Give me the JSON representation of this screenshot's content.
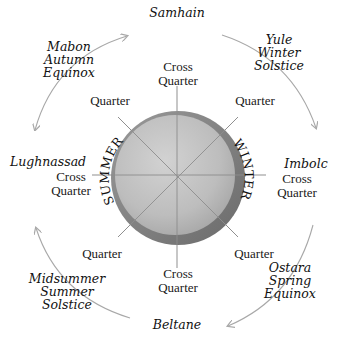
{
  "diagram": {
    "center_labels": {
      "left": "SUMMER",
      "right": "WINTER"
    },
    "festivals": {
      "top": {
        "lines": [
          "Samhain"
        ]
      },
      "top_right": {
        "lines": [
          "Yule",
          "Winter",
          "Solstice"
        ]
      },
      "right": {
        "lines": [
          "Imbolc"
        ]
      },
      "bottom_right": {
        "lines": [
          "Ostara",
          "Spring",
          "Equinox"
        ]
      },
      "bottom": {
        "lines": [
          "Beltane"
        ]
      },
      "bottom_left": {
        "lines": [
          "Midsummer",
          "Summer",
          "Solstice"
        ]
      },
      "left": {
        "lines": [
          "Lughnassad"
        ]
      },
      "top_left": {
        "lines": [
          "Mabon",
          "Autumn",
          "Equinox"
        ]
      }
    },
    "quarters": {
      "top": {
        "lines": [
          "Cross",
          "Quarter"
        ]
      },
      "top_right": {
        "lines": [
          "Quarter"
        ]
      },
      "right": {
        "lines": [
          "Cross",
          "Quarter"
        ]
      },
      "bottom_right": {
        "lines": [
          "Quarter"
        ]
      },
      "bottom": {
        "lines": [
          "Cross",
          "Quarter"
        ]
      },
      "bottom_left": {
        "lines": [
          "Quarter"
        ]
      },
      "left": {
        "lines": [
          "Cross",
          "Quarter"
        ]
      },
      "top_left": {
        "lines": [
          "Quarter"
        ]
      }
    },
    "colors": {
      "disc_light": "#c9c9c9",
      "disc_mid": "#b3b3b3",
      "disc_rim": "#8f8f8f",
      "disc_rim_dark": "#6e6e6e",
      "spoke": "#8a8a8a",
      "arc": "#a8a8a8",
      "text": "#111111"
    }
  }
}
